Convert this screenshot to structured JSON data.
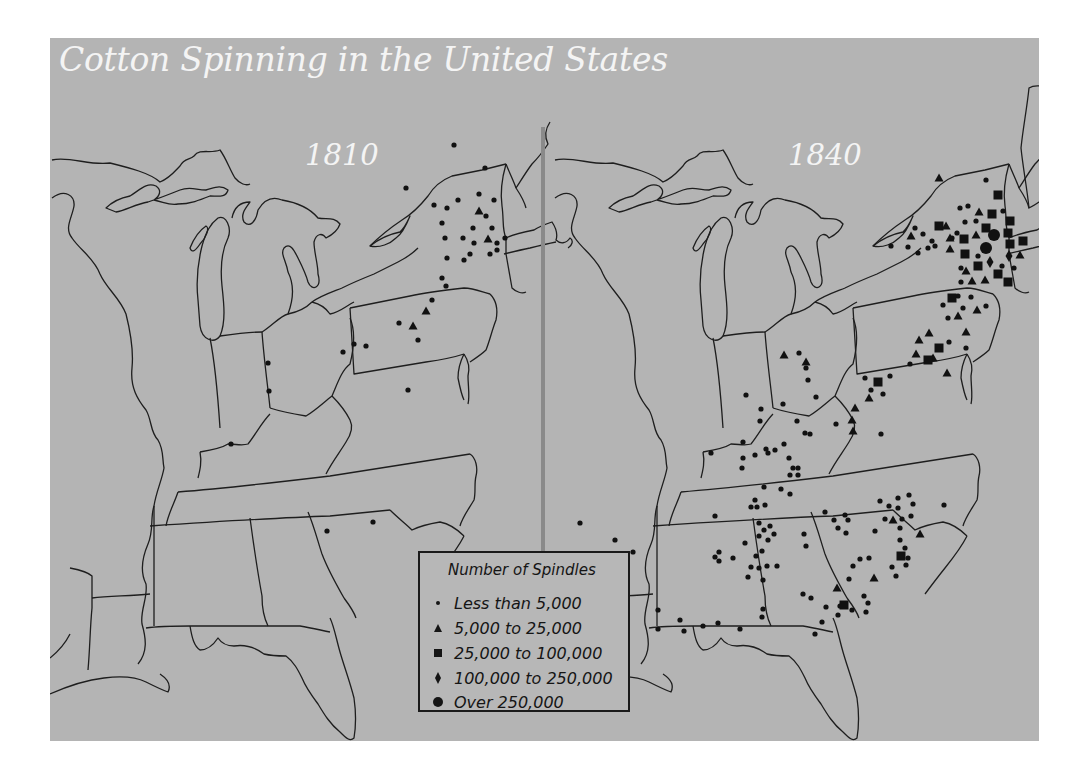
{
  "title": "Cotton Spinning in the United States",
  "maps": [
    {
      "year": "1810"
    },
    {
      "year": "1840"
    }
  ],
  "colors": {
    "panel_bg": "#b4b4b4",
    "title_text": "#f4f4f4",
    "boundary_lines": "#1e1e1e",
    "markers": "#111111",
    "divider": "#8a8a8a"
  },
  "legend": {
    "title": "Number of Spindles",
    "items": [
      {
        "symbol": "small-dot",
        "label": "Less than 5,000"
      },
      {
        "symbol": "triangle",
        "label": "5,000 to 25,000"
      },
      {
        "symbol": "square",
        "label": "25,000 to 100,000"
      },
      {
        "symbol": "diamond",
        "label": "100,000 to 250,000"
      },
      {
        "symbol": "large-circle",
        "label": "Over 250,000"
      }
    ]
  }
}
